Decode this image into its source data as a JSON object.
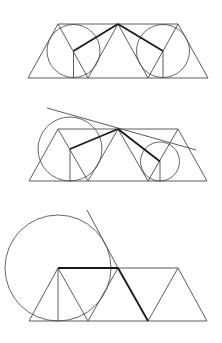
{
  "diagram": {
    "colors": {
      "background": "#ffffff",
      "thin_stroke": "#4a4a4a",
      "thick_stroke": "#1a1a1a",
      "circle_stroke": "#555555"
    },
    "figures": [
      {
        "id": "figure-1",
        "strip": {
          "top_y": 24,
          "bottom_y": 78,
          "top_x": [
            58,
            118,
            178
          ],
          "bottom_x": [
            28,
            88,
            148,
            208
          ]
        },
        "circles": [
          {
            "cx": 73.5,
            "cy": 51,
            "r": 26.5
          },
          {
            "cx": 163,
            "cy": 51,
            "r": 26.5
          }
        ],
        "thick_segments": [
          [
            118,
            24,
            73.5,
            51
          ],
          [
            118,
            24,
            163,
            51
          ]
        ],
        "verticals": [
          [
            73.5,
            51,
            73.5,
            78
          ],
          [
            163,
            51,
            163,
            78
          ]
        ],
        "tangent_lines": []
      },
      {
        "id": "figure-2",
        "strip": {
          "top_y": 129,
          "bottom_y": 181,
          "top_x": [
            58,
            118,
            178
          ],
          "bottom_x": [
            29,
            88,
            148,
            207
          ]
        },
        "circles": [
          {
            "cx": 70,
            "cy": 149,
            "r": 32
          },
          {
            "cx": 160,
            "cy": 161.5,
            "r": 19.5
          }
        ],
        "thick_segments": [
          [
            118,
            129,
            70,
            149
          ],
          [
            118,
            129,
            160,
            161.5
          ]
        ],
        "verticals": [
          [
            70,
            149,
            70,
            181
          ],
          [
            160,
            161.5,
            160,
            181
          ]
        ],
        "tangent_lines": [
          [
            47,
            108,
            196,
            150
          ]
        ]
      },
      {
        "id": "figure-3",
        "strip": {
          "top_y": 268,
          "bottom_y": 321,
          "top_x": [
            58,
            118,
            178
          ],
          "bottom_x": [
            29,
            88,
            148,
            207
          ]
        },
        "circles": [
          {
            "cx": 58,
            "cy": 268,
            "r": 53
          }
        ],
        "thick_segments": [
          [
            58,
            268,
            118,
            268
          ],
          [
            118,
            268,
            148,
            321
          ]
        ],
        "verticals": [
          [
            58,
            268,
            58,
            321
          ]
        ],
        "tangent_lines": [
          [
            87,
            210,
            118,
            268
          ]
        ]
      }
    ]
  }
}
